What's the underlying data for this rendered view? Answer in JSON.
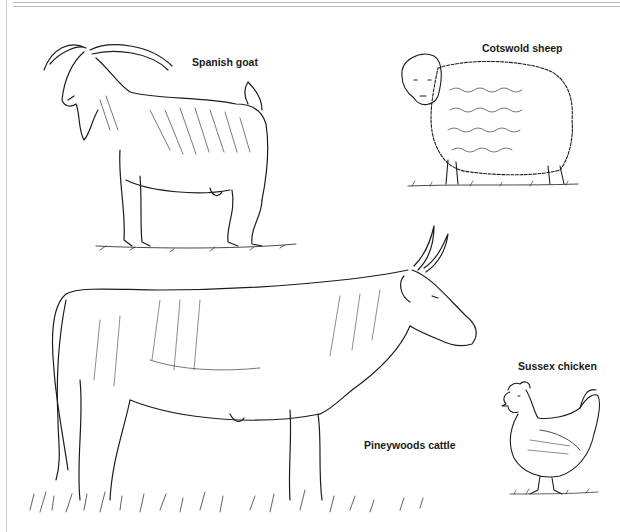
{
  "illustrations": [
    {
      "id": "goat",
      "label": "Spanish goat"
    },
    {
      "id": "sheep",
      "label": "Cotswold sheep"
    },
    {
      "id": "cattle",
      "label": "Pineywoods cattle"
    },
    {
      "id": "chicken",
      "label": "Sussex chicken"
    }
  ]
}
